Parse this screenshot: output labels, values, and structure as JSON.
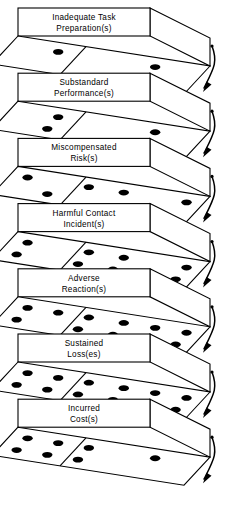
{
  "diagram": {
    "type": "cascade-sequence",
    "background_color": "#ffffff",
    "line_color": "#000000",
    "dot_color": "#000000",
    "levels": [
      {
        "index": 1,
        "label_line1": "Inadequate Task",
        "label_line2": "Preparation(s)",
        "dot_count": 2,
        "dots_left": 1,
        "dots_right": 1
      },
      {
        "index": 2,
        "label_line1": "Substandard",
        "label_line2": "Performance(s)",
        "dot_count": 4,
        "dots_left": 2,
        "dots_right": 2
      },
      {
        "index": 3,
        "label_line1": "Miscompensated",
        "label_line2": "Risk(s)",
        "dot_count": 6,
        "dots_left": 3,
        "dots_right": 3
      },
      {
        "index": 4,
        "label_line1": "Harmful Contact",
        "label_line2": "Incident(s)",
        "dot_count": 8,
        "dots_left": 4,
        "dots_right": 4
      },
      {
        "index": 5,
        "label_line1": "Adverse",
        "label_line2": "Reaction(s)",
        "dot_count": 10,
        "dots_left": 5,
        "dots_right": 5
      },
      {
        "index": 6,
        "label_line1": "Sustained",
        "label_line2": "Loss(es)",
        "dot_count": 12,
        "dots_left": 6,
        "dots_right": 6
      },
      {
        "index": 7,
        "label_line1": "Incurred",
        "label_line2": "Cost(s)",
        "dot_count": 7,
        "dots_left": 6,
        "dots_right": 1
      }
    ],
    "connectors": [
      {
        "from": 1,
        "to": 2,
        "icon": "curved-down-arrow"
      },
      {
        "from": 2,
        "to": 3,
        "icon": "curved-down-arrow"
      },
      {
        "from": 3,
        "to": 4,
        "icon": "curved-down-arrow"
      },
      {
        "from": 4,
        "to": 5,
        "icon": "curved-down-arrow"
      },
      {
        "from": 5,
        "to": 6,
        "icon": "curved-down-arrow"
      },
      {
        "from": 6,
        "to": 7,
        "icon": "curved-down-arrow"
      },
      {
        "from": 7,
        "to": 8,
        "icon": "curved-down-arrow"
      }
    ]
  }
}
